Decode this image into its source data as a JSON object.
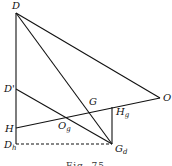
{
  "diagram": {
    "caption": "Fig. 75",
    "points": {
      "D": {
        "label": "D",
        "sub": "",
        "x": 16,
        "y": 13
      },
      "Dp": {
        "label": "D'",
        "sub": "",
        "x": 16,
        "y": 89
      },
      "H": {
        "label": "H",
        "sub": "",
        "x": 16,
        "y": 128
      },
      "Dh": {
        "label": "D",
        "sub": "h",
        "x": 16,
        "y": 144
      },
      "G": {
        "label": "G",
        "sub": "",
        "x": 94,
        "y": 110
      },
      "Hg": {
        "label": "H",
        "sub": "g",
        "x": 112,
        "y": 107
      },
      "Gd": {
        "label": "G",
        "sub": "d",
        "x": 112,
        "y": 144
      },
      "Og": {
        "label": "O",
        "sub": "g",
        "x": 65,
        "y": 118
      },
      "O": {
        "label": "O",
        "sub": "",
        "x": 160,
        "y": 98
      }
    },
    "segments": [
      {
        "from": "D",
        "to": "Dh",
        "style": "solid"
      },
      {
        "from": "D",
        "to": "O",
        "style": "solid"
      },
      {
        "from": "D",
        "to": "Gd",
        "style": "solid"
      },
      {
        "from": "Dp",
        "to": "Gd",
        "style": "solid"
      },
      {
        "from": "H",
        "to": "O",
        "style": "solid"
      },
      {
        "from": "Hg",
        "to": "Gd",
        "style": "solid"
      },
      {
        "from": "Dh",
        "to": "Gd",
        "style": "dashed"
      }
    ]
  }
}
